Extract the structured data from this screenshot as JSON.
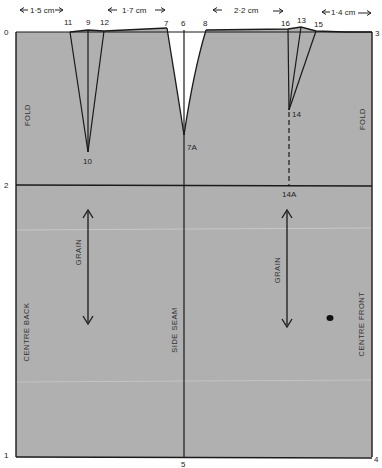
{
  "diagram": {
    "type": "sewing-pattern-draft",
    "colors": {
      "fabric": "#b0b0b0",
      "line": "#1a1a1a",
      "background": "#ffffff",
      "text": "#222222"
    },
    "measurements": {
      "back_dart_offset": "1·5 cm",
      "side_dart_offset": "1·7 cm",
      "front_dart_offset": "2·2 cm",
      "front_edge_offset": "1·4 cm"
    },
    "points": {
      "p0": "0",
      "p1": "1",
      "p2": "2",
      "p3": "3",
      "p4": "4",
      "p5": "5",
      "p6": "6",
      "p7": "7",
      "p7a": "7A",
      "p8": "8",
      "p9": "9",
      "p10": "10",
      "p11": "11",
      "p12": "12",
      "p13": "13",
      "p14": "14",
      "p14a": "14A",
      "p15": "15",
      "p16": "16"
    },
    "labels": {
      "fold_left": "FOLD",
      "fold_right": "FOLD",
      "grain_left": "GRAIN",
      "grain_right": "GRAIN",
      "centre_back": "CENTRE BACK",
      "side_seam": "SIDE SEAM",
      "centre_front": "CENTRE FRONT"
    }
  }
}
